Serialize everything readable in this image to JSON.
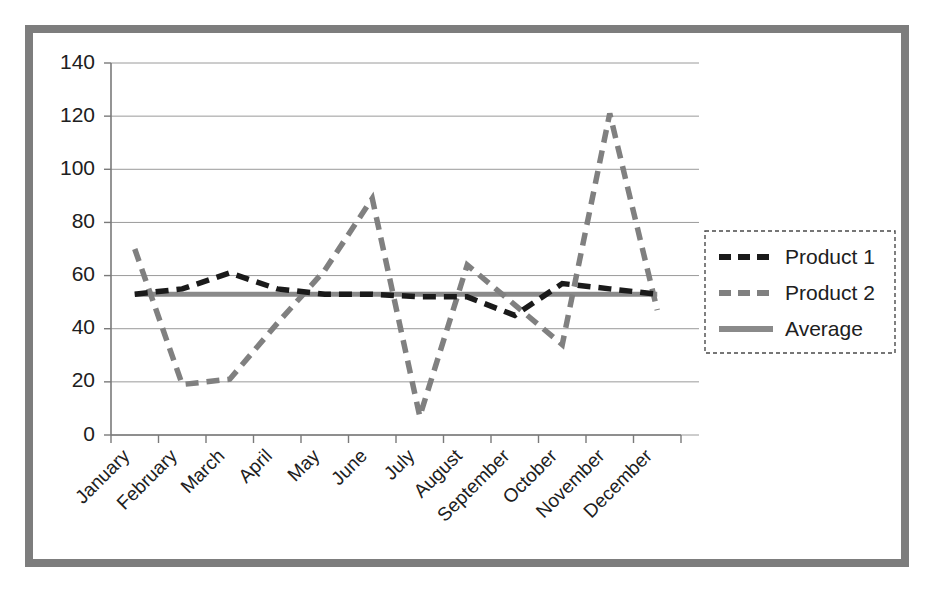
{
  "chart_data": {
    "type": "line",
    "title": "",
    "xlabel": "",
    "ylabel": "",
    "ylim": [
      0,
      140
    ],
    "yticks": [
      0,
      20,
      40,
      60,
      80,
      100,
      120,
      140
    ],
    "grid": true,
    "legend_position": "right",
    "categories": [
      "January",
      "February",
      "March",
      "April",
      "May",
      "June",
      "July",
      "August",
      "September",
      "October",
      "November",
      "December"
    ],
    "series": [
      {
        "name": "Product 1",
        "style": "dashed",
        "color": "#1a1a1a",
        "values": [
          53,
          55,
          61,
          55,
          53,
          53,
          52,
          52,
          45,
          57,
          55,
          53
        ]
      },
      {
        "name": "Product 2",
        "style": "dashed",
        "color": "#808080",
        "values": [
          70,
          19,
          21,
          42,
          62,
          89,
          7,
          64,
          49,
          34,
          121,
          47
        ]
      },
      {
        "name": "Average",
        "style": "solid",
        "color": "#8a8a8a",
        "values": [
          53,
          53,
          53,
          53,
          53,
          53,
          53,
          53,
          53,
          53,
          53,
          53
        ]
      }
    ]
  },
  "ytick_labels": [
    "140",
    "120",
    "100",
    "80",
    "60",
    "40",
    "20",
    "0"
  ],
  "xtick_labels": [
    "January",
    "February",
    "March",
    "April",
    "May",
    "June",
    "July",
    "August",
    "September",
    "October",
    "November",
    "December"
  ],
  "legend": {
    "entries": [
      {
        "label": "Product 1",
        "swatch": "dashed-black-line"
      },
      {
        "label": "Product 2",
        "swatch": "dashed-gray-line"
      },
      {
        "label": "Average",
        "swatch": "solid-gray-line"
      }
    ]
  },
  "colors": {
    "frame_border": "#7d7d7d",
    "product1": "#1a1a1a",
    "product2": "#808080",
    "average": "#8a8a8a",
    "gridline": "#9a9a9a",
    "text": "#202020"
  }
}
